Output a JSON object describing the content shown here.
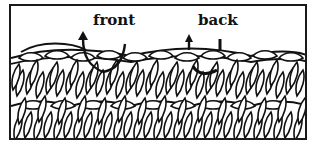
{
  "diagram": {
    "labels": {
      "front": "front",
      "back": "back"
    },
    "arrows": [
      {
        "target": "front",
        "direction": "up"
      },
      {
        "target": "back",
        "direction": "up"
      }
    ],
    "colors": {
      "ink": "#111111",
      "paper": "#ffffff"
    }
  }
}
